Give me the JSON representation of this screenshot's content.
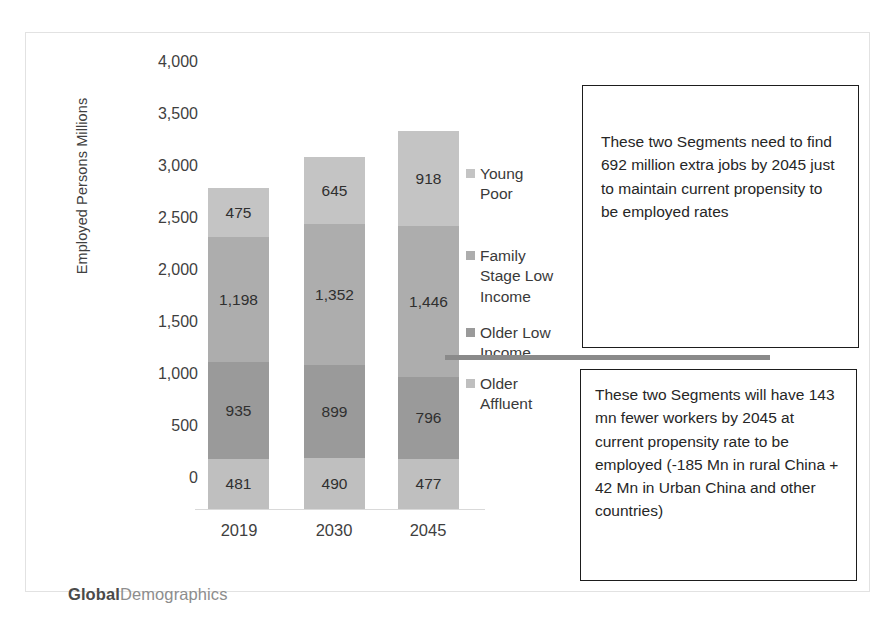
{
  "chart_data": {
    "type": "bar",
    "subtype": "stacked-bar",
    "title": "",
    "xlabel": "",
    "ylabel": "Employed Persons Millions",
    "categories": [
      "2019",
      "2030",
      "2045"
    ],
    "ylim": [
      0,
      4000
    ],
    "yticks": [
      "0",
      "500",
      "1,000",
      "1,500",
      "2,000",
      "2,500",
      "3,000",
      "3,500",
      "4,000"
    ],
    "ytick_values": [
      0,
      500,
      1000,
      1500,
      2000,
      2500,
      3000,
      3500,
      4000
    ],
    "grid": false,
    "legend_position": "right",
    "series": [
      {
        "name": "Older Affluent",
        "values": [
          481,
          490,
          477
        ],
        "labels": [
          "481",
          "490",
          "477"
        ],
        "color": "#bfbfbf"
      },
      {
        "name": "Older Low Income",
        "values": [
          935,
          899,
          796
        ],
        "labels": [
          "935",
          "899",
          "796"
        ],
        "color": "#9a9a9a"
      },
      {
        "name": "Family Stage Low Income",
        "values": [
          1198,
          1352,
          1446
        ],
        "labels": [
          "1,198",
          "1,352",
          "1,446"
        ],
        "color": "#adadad"
      },
      {
        "name": "Young Poor",
        "values": [
          475,
          645,
          918
        ],
        "labels": [
          "475",
          "645",
          "918"
        ],
        "color": "#c4c4c4"
      }
    ],
    "totals": [
      3089,
      3386,
      3637
    ]
  },
  "axis": {
    "y_title": "Employed Persons Millions",
    "ticks": [
      "4,000",
      "3,500",
      "3,000",
      "2,500",
      "2,000",
      "1,500",
      "1,000",
      "500",
      "0"
    ],
    "categories": [
      "2019",
      "2030",
      "2045"
    ]
  },
  "legend": {
    "items": [
      {
        "label": "Young Poor",
        "color": "#c4c4c4"
      },
      {
        "label": "Family Stage Low Income",
        "color": "#adadad"
      },
      {
        "label": "Older Low Income",
        "color": "#9a9a9a"
      },
      {
        "label": "Older Affluent",
        "color": "#bfbfbf"
      }
    ]
  },
  "callouts": [
    {
      "text": "These two Segments need to find 692 million extra jobs by 2045 just to maintain  current propensity to be employed rates"
    },
    {
      "text": "These two Segments will have 143 mn fewer workers by 2045 at current propensity rate to be employed  (-185 Mn in rural China + 42 Mn in Urban China and other countries)"
    }
  ],
  "branding": {
    "bold_part": "Global",
    "light_part": "Demographics"
  },
  "colors": {
    "frame": "#e2e2e2",
    "divider": "#8a8a8a",
    "callout_border": "#1d1d1d",
    "text": "#3b3b3b"
  }
}
